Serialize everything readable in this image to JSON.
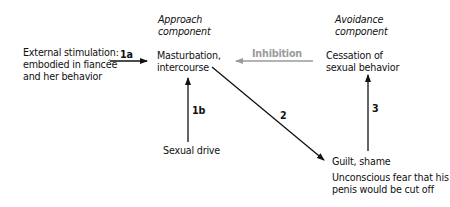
{
  "headers": {
    "approach": [
      "Approach",
      "component"
    ],
    "avoidance": [
      "Avoidance",
      "component"
    ]
  },
  "nodes": {
    "external": [
      "External stimulation:",
      "embodied in fiancée",
      "and her behavior"
    ],
    "masturbation": [
      "Masturbation,",
      "intercourse"
    ],
    "cessation": [
      "Cessation of",
      "sexual behavior"
    ],
    "drive": "Sexual drive",
    "guilt": "Guilt, shame",
    "fear": [
      "Unconscious fear that his",
      "penis would be cut off"
    ]
  },
  "edges": {
    "e1a": "1a",
    "e1b": "1b",
    "e2": "2",
    "e3": "3",
    "inhibition": "Inhibition"
  },
  "colors": {
    "line": "#111111",
    "inhibition": "#9a9a9a"
  }
}
